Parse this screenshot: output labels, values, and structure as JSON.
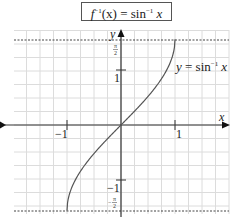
{
  "title": {
    "f": "f",
    "sup1": "−1",
    "arg": "(x)",
    "eq": " = sin",
    "sup2": "−1",
    "var": "x"
  },
  "colors": {
    "grid": "#dcdcdc",
    "axis": "#333333",
    "curve": "#555555",
    "dotted": "#444444",
    "text": "#222222"
  },
  "chart_data": {
    "type": "line",
    "xlabel": "x",
    "ylabel": "y",
    "x_ticks": [
      {
        "value": -1,
        "label": "−1"
      },
      {
        "value": 1,
        "label": "1"
      }
    ],
    "y_ticks": [
      {
        "value": 1,
        "label": "1"
      },
      {
        "value": -1,
        "label": "−1"
      },
      {
        "value": 1.5708,
        "label": "π/2"
      },
      {
        "value": -1.5708,
        "label": "−π/2"
      }
    ],
    "asymptote_lines": [
      1.5708,
      -1.5708
    ],
    "series": [
      {
        "name": "y = sin⁻¹ x",
        "x": [
          -1,
          -0.9,
          -0.75,
          -0.5,
          -0.25,
          0,
          0.25,
          0.5,
          0.75,
          0.9,
          1
        ],
        "y": [
          -1.5708,
          -1.1198,
          -0.8481,
          -0.5236,
          -0.2527,
          0,
          0.2527,
          0.5236,
          0.8481,
          1.1198,
          1.5708
        ]
      }
    ],
    "xlim": [
      -2,
      2
    ],
    "ylim": [
      -1.7,
      1.7
    ],
    "grid": true,
    "curve_label": "y = sin⁻¹ x"
  },
  "labels": {
    "x_axis": "x",
    "y_axis": "y",
    "x_neg1": "−1",
    "x_pos1": "1",
    "y_pos1": "1",
    "y_neg1": "−1",
    "pi_num": "π",
    "pi_den": "2",
    "neg_pi_num": "π",
    "neg_pi_den": "2",
    "neg_sign": "−",
    "curve_label_y": "y",
    "curve_label_eq": " = sin",
    "curve_label_sup": "−1",
    "curve_label_x": "x"
  }
}
